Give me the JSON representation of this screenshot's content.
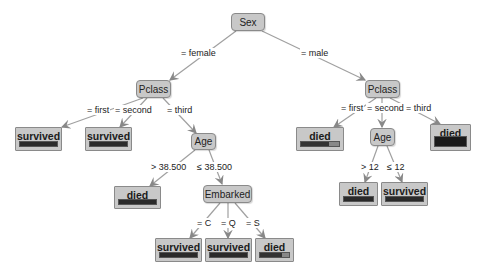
{
  "tree": {
    "root": {
      "label": "Sex"
    },
    "edges": {
      "female": "= female",
      "male": "= male",
      "f_first": "= first",
      "f_second": "= second",
      "f_third": "= third",
      "m_first": "= first",
      "m_second": "= second",
      "m_third": "= third",
      "age_gt": "> 38.500",
      "age_le": "≤ 38.500",
      "emb_c": "= C",
      "emb_q": "= Q",
      "emb_s": "= S",
      "age_gt12": "> 12",
      "age_le12": "≤ 12"
    },
    "nodes": {
      "pclass_female": "Pclass",
      "pclass_male": "Pclass",
      "age_female": "Age",
      "embarked": "Embarked",
      "age_male": "Age"
    },
    "leaves": {
      "f_first": "survived",
      "f_second": "survived",
      "f_age_gt": "died",
      "emb_c": "survived",
      "emb_q": "survived",
      "emb_s": "died",
      "m_first": "died",
      "m_age_gt12": "died",
      "m_age_le12": "survived",
      "m_third": "died"
    }
  }
}
